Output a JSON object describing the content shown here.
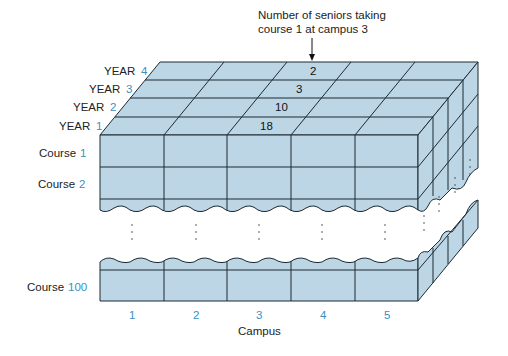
{
  "annotation": {
    "line1": "Number of seniors taking",
    "line2": "course 1 at campus 3"
  },
  "year_labels": [
    {
      "word": "YEAR",
      "num": "4"
    },
    {
      "word": "YEAR",
      "num": "3"
    },
    {
      "word": "YEAR",
      "num": "2"
    },
    {
      "word": "YEAR",
      "num": "1"
    }
  ],
  "course_labels": [
    {
      "word": "Course",
      "num": "1"
    },
    {
      "word": "Course",
      "num": "2"
    },
    {
      "word": "Course",
      "num": "100"
    }
  ],
  "campus_ticks": [
    "1",
    "2",
    "3",
    "4",
    "5"
  ],
  "campus_axis_label": "Campus",
  "cell_values": [
    {
      "year": "4",
      "course": "1",
      "campus": "3",
      "value": "2"
    },
    {
      "year": "3",
      "course": "1",
      "campus": "3",
      "value": "3"
    },
    {
      "year": "2",
      "course": "1",
      "campus": "3",
      "value": "10"
    },
    {
      "year": "1",
      "course": "1",
      "campus": "3",
      "value": "18"
    }
  ],
  "colors": {
    "face": "#bcd6e6",
    "line": "#1d2a33",
    "accent_number": "#3a8fc0"
  }
}
